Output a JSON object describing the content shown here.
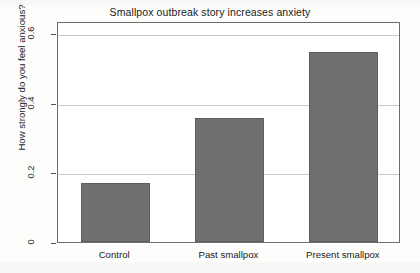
{
  "chart_data": {
    "type": "bar",
    "title": "Smallpox outbreak story increases anxiety",
    "xlabel": "",
    "ylabel": "How strongly do you feel anxious?",
    "categories": [
      "Control",
      "Past smallpox",
      "Present smallpox"
    ],
    "values": [
      0.17,
      0.355,
      0.545
    ],
    "ylim": [
      0,
      0.635
    ],
    "yticks": [
      0,
      0.2,
      0.4,
      0.6
    ],
    "ytick_labels": [
      "0",
      "0.2",
      "0.4",
      "0.6"
    ],
    "grid": true,
    "grid_axis": "y",
    "legend": null,
    "bar_color": "#707070",
    "bar_edge_color": "#5d5d5d",
    "grid_color": "#c9c9c9",
    "frame_color": "#6e6e6e",
    "background_color": "#ffffff"
  }
}
